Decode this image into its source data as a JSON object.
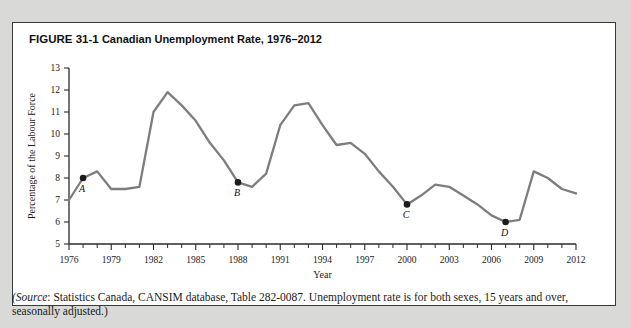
{
  "figure": {
    "number": "FIGURE 31-1",
    "title": "Canadian Unemployment Rate, 1976–2012"
  },
  "source_note": {
    "lead": "(Source",
    "body": ": Statistics Canada, CANSIM database, Table 282-0087. Unemployment rate is for both sexes, 15 years and over, seasonally adjusted.)"
  },
  "colors": {
    "line": "#7d7d7d",
    "dot": "#1c1c1c",
    "axis": "#2b2b2b",
    "page_bg": "#d9d9d7",
    "panel_bg": "#ffffff",
    "panel_border": "#3a3a3a"
  },
  "chart_data": {
    "type": "line",
    "title": "Canadian Unemployment Rate, 1976–2012",
    "xlabel": "Year",
    "ylabel": "Percentage of the Labour Force",
    "xlim": [
      1976,
      2012
    ],
    "ylim": [
      5,
      13
    ],
    "ytick_step": 1,
    "yticks": [
      5,
      6,
      7,
      8,
      9,
      10,
      11,
      12,
      13
    ],
    "xtick_step": 1,
    "xtick_labels": [
      1976,
      1979,
      1982,
      1985,
      1988,
      1991,
      1994,
      1997,
      2000,
      2003,
      2006,
      2009,
      2012
    ],
    "xtick_label_step": 3,
    "grid": false,
    "legend": "none",
    "x": [
      1976,
      1977,
      1978,
      1979,
      1980,
      1981,
      1982,
      1983,
      1984,
      1985,
      1986,
      1987,
      1988,
      1989,
      1990,
      1991,
      1992,
      1993,
      1994,
      1995,
      1996,
      1997,
      1998,
      1999,
      2000,
      2001,
      2002,
      2003,
      2004,
      2005,
      2006,
      2007,
      2008,
      2009,
      2010,
      2011,
      2012
    ],
    "series": [
      {
        "name": "Unemployment rate",
        "values": [
          7.0,
          8.0,
          8.3,
          7.5,
          7.5,
          7.6,
          11.0,
          11.9,
          11.3,
          10.6,
          9.6,
          8.8,
          7.8,
          7.6,
          8.2,
          10.4,
          11.3,
          11.4,
          10.4,
          9.5,
          9.6,
          9.1,
          8.3,
          7.6,
          6.8,
          7.2,
          7.7,
          7.6,
          7.2,
          6.8,
          6.3,
          6.0,
          6.1,
          8.3,
          8.0,
          7.5,
          7.3
        ]
      }
    ],
    "annotations": [
      {
        "label": "A",
        "x": 1977,
        "y": 8.0
      },
      {
        "label": "B",
        "x": 1988,
        "y": 7.8
      },
      {
        "label": "C",
        "x": 2000,
        "y": 6.8
      },
      {
        "label": "D",
        "x": 2007,
        "y": 6.0
      }
    ]
  }
}
